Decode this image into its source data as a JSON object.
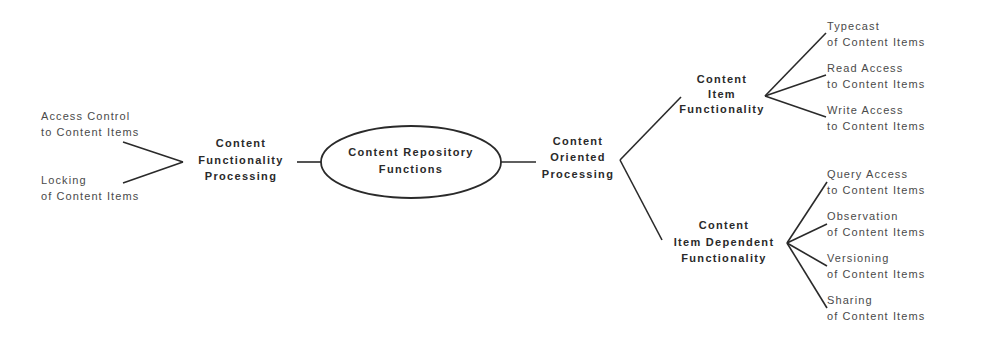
{
  "diagram": {
    "center": {
      "line1": "Content Repository",
      "line2": "Functions"
    },
    "left_branch": {
      "node": {
        "line1": "Content",
        "line2": "Functionality",
        "line3": "Processing"
      },
      "leaves": [
        {
          "line1": "Access Control",
          "line2": "to Content Items"
        },
        {
          "line1": "Locking",
          "line2": "of Content Items"
        }
      ]
    },
    "right_branch": {
      "node": {
        "line1": "Content",
        "line2": "Oriented",
        "line3": "Processing"
      },
      "upper": {
        "node": {
          "line1": "Content",
          "line2": "Item",
          "line3": "Functionality"
        },
        "leaves": [
          {
            "line1": "Typecast",
            "line2": "of Content Items"
          },
          {
            "line1": "Read Access",
            "line2": "to Content Items"
          },
          {
            "line1": "Write Access",
            "line2": "to Content Items"
          }
        ]
      },
      "lower": {
        "node": {
          "line1": "Content",
          "line2": "Item Dependent",
          "line3": "Functionality"
        },
        "leaves": [
          {
            "line1": "Query Access",
            "line2": "to Content Items"
          },
          {
            "line1": "Observation",
            "line2": "of Content Items"
          },
          {
            "line1": "Versioning",
            "line2": "of Content Items"
          },
          {
            "line1": "Sharing",
            "line2": "of Content Items"
          }
        ]
      }
    }
  }
}
